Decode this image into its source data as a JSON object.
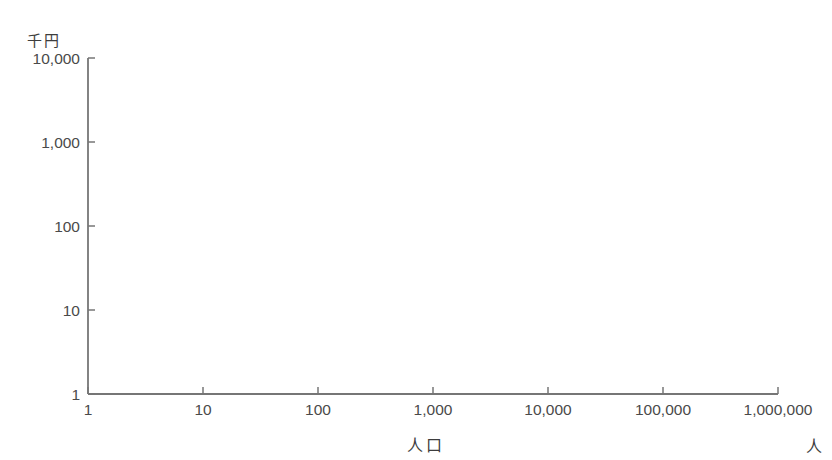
{
  "page": {
    "background": "#ffffff"
  },
  "title_fragment": {
    "color": "#8f8f8f",
    "marks": [
      [
        158,
        18
      ],
      [
        181,
        50
      ],
      [
        238,
        15
      ],
      [
        257,
        12
      ],
      [
        284,
        17
      ],
      [
        312,
        21
      ],
      [
        345,
        11
      ],
      [
        390,
        33
      ],
      [
        430,
        13
      ],
      [
        456,
        17
      ],
      [
        490,
        14
      ],
      [
        520,
        13
      ],
      [
        545,
        18
      ],
      [
        575,
        26
      ],
      [
        648,
        25
      ],
      [
        680,
        21
      ],
      [
        712,
        19
      ]
    ]
  },
  "chart_data": {
    "type": "scatter",
    "xlabel": "人口",
    "x_unit": "人",
    "ylabel": "1人当たり歳出額",
    "y_unit": "千円",
    "x_scale": "log",
    "y_scale": "log",
    "xlim": [
      1,
      1000000
    ],
    "ylim": [
      1,
      10000
    ],
    "x_ticks": {
      "values": [
        1,
        10,
        100,
        1000,
        10000,
        100000,
        1000000
      ],
      "labels": [
        "1",
        "10",
        "100",
        "1,000",
        "10,000",
        "100,000",
        "1,000,000"
      ]
    },
    "y_ticks": {
      "values": [
        1,
        10,
        100,
        1000,
        10000
      ],
      "labels": [
        "1",
        "10",
        "100",
        "1,000",
        "10,000"
      ]
    },
    "grid": false,
    "legend": false,
    "marker": {
      "shape": "square-blob",
      "size_px": 5,
      "color": "#1c1c1c"
    },
    "cloud_model": {
      "description": "dense overplotted cloud of municipalities: per-capita expenditure (thousand yen) falls from ~4000 at population ~200 to ~200 at population ~100,000-800,000",
      "n_points": 850,
      "seed": 20240611,
      "log10_pop": {
        "mean": 4.35,
        "sd": 0.75,
        "min": 2.26,
        "max": 5.93
      },
      "trend_log10_y": {
        "base": 2.3,
        "amp": 1.3,
        "t0": 2.3,
        "tau": 1.1
      },
      "noise_sd": 0.135,
      "noise_sd_low_t": 0.17,
      "u_min": 2.02,
      "u_max": 3.78
    },
    "notable_points": {
      "high": [
        [
          200,
          4500
        ],
        [
          215,
          5100
        ],
        [
          350,
          4600
        ],
        [
          520,
          6300
        ],
        [
          740,
          7600
        ],
        [
          770,
          4500
        ],
        [
          2230,
          7100
        ]
      ],
      "low": [
        [
          31600,
          95
        ],
        [
          51000,
          83
        ]
      ]
    }
  },
  "style": {
    "axis_color": "#767676",
    "tick_label_color": "#4a4a4a",
    "label_color": "#3d3d3d"
  }
}
